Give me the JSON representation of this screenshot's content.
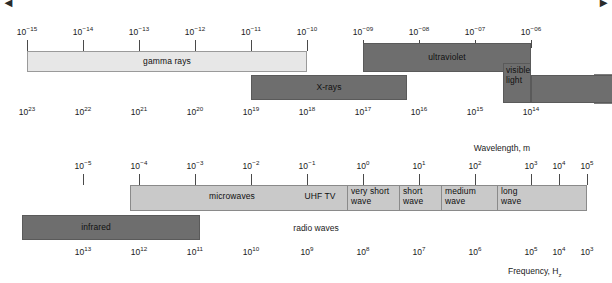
{
  "figure": {
    "background": "#ffffff",
    "corner_top_left": "◄",
    "corner_top_right": "►"
  },
  "colors": {
    "band_light": "#d6d6d6",
    "band_lightest": "#e7e7e7",
    "band_dark": "#6e6e6e",
    "band_mid": "#c9c9c9",
    "stroke": "#7d7d7d",
    "text": "#101010"
  },
  "chart_data": {
    "type": "diagram",
    "xlabel_top": "Wavelength, m",
    "xlabel_bottom": "Frequency, Hz",
    "rows": [
      {
        "id": "upper",
        "wavelength_ticks": [
          "10⁻¹⁵",
          "10⁻¹⁴",
          "10⁻¹³",
          "10⁻¹²",
          "10⁻¹¹",
          "10⁻¹⁰",
          "10⁻⁰⁹",
          "10⁻⁰⁸",
          "10⁻⁰⁷",
          "10⁻⁰⁶"
        ],
        "frequency_ticks": [
          "10²³",
          "10²²",
          "10²¹",
          "10²⁰",
          "10¹⁹",
          "10¹⁸",
          "10¹⁷",
          "10¹⁶",
          "10¹⁵",
          "10¹⁴"
        ],
        "bands": [
          {
            "name": "gamma rays",
            "from": "10⁻¹⁵",
            "to": "10⁻¹⁰",
            "shade": "lightest"
          },
          {
            "name": "ultraviolet",
            "from": "10⁻⁰⁹",
            "to": "10⁻⁰⁶",
            "shade": "dark"
          },
          {
            "name": "X-rays",
            "from": "10⁻¹¹·⁵",
            "to": "10⁻¹⁶",
            "shade": "dark"
          },
          {
            "name": "visible light",
            "from": "10⁻⁰⁶·⁵",
            "to": "10⁻⁰⁶",
            "shade": "dark"
          }
        ]
      },
      {
        "id": "lower",
        "wavelength_ticks": [
          "10⁻⁵",
          "10⁻⁴",
          "10⁻³",
          "10⁻²",
          "10⁻¹",
          "10⁰",
          "10¹",
          "10²",
          "10³",
          "10⁴",
          "10⁵"
        ],
        "frequency_ticks": [
          "10¹³",
          "10¹²",
          "10¹¹",
          "10¹⁰",
          "10⁹",
          "10⁸",
          "10⁷",
          "10⁶",
          "10⁵",
          "10⁴",
          "10³"
        ],
        "bands": [
          {
            "name": "infrared",
            "shade": "dark"
          },
          {
            "name": "microwaves",
            "shade": "mid"
          },
          {
            "name": "UHF TV",
            "shade": "mid"
          },
          {
            "name": "very short wave",
            "shade": "mid"
          },
          {
            "name": "short wave",
            "shade": "mid"
          },
          {
            "name": "medium wave",
            "shade": "mid"
          },
          {
            "name": "long wave",
            "shade": "mid"
          },
          {
            "name": "radio waves",
            "shade": "none"
          }
        ]
      }
    ]
  },
  "top": {
    "wavelength_ticks": [
      {
        "label": "10",
        "exp": "−15",
        "x": 27
      },
      {
        "label": "10",
        "exp": "−14",
        "x": 83
      },
      {
        "label": "10",
        "exp": "−13",
        "x": 139
      },
      {
        "label": "10",
        "exp": "−12",
        "x": 195
      },
      {
        "label": "10",
        "exp": "−11",
        "x": 251
      },
      {
        "label": "10",
        "exp": "−10",
        "x": 307
      },
      {
        "label": "10",
        "exp": "−09",
        "x": 363
      },
      {
        "label": "10",
        "exp": "−08",
        "x": 419
      },
      {
        "label": "10",
        "exp": "−07",
        "x": 475
      },
      {
        "label": "10",
        "exp": "−06",
        "x": 531
      }
    ],
    "frequency_ticks": [
      {
        "label": "10",
        "exp": "23",
        "x": 27
      },
      {
        "label": "10",
        "exp": "22",
        "x": 83
      },
      {
        "label": "10",
        "exp": "21",
        "x": 139
      },
      {
        "label": "10",
        "exp": "20",
        "x": 195
      },
      {
        "label": "10",
        "exp": "19",
        "x": 251
      },
      {
        "label": "10",
        "exp": "18",
        "x": 307
      },
      {
        "label": "10",
        "exp": "17",
        "x": 363
      },
      {
        "label": "10",
        "exp": "16",
        "x": 419
      },
      {
        "label": "10",
        "exp": "15",
        "x": 475
      },
      {
        "label": "10",
        "exp": "14",
        "x": 531
      }
    ],
    "bands": {
      "gamma": "gamma rays",
      "xrays": "X-rays",
      "ultraviolet": "ultraviolet",
      "visible_line1": "visible",
      "visible_line2": "light"
    }
  },
  "bottom": {
    "wavelength_ticks": [
      {
        "label": "10",
        "exp": "−5",
        "x": 83
      },
      {
        "label": "10",
        "exp": "−4",
        "x": 139
      },
      {
        "label": "10",
        "exp": "−3",
        "x": 195
      },
      {
        "label": "10",
        "exp": "−2",
        "x": 251
      },
      {
        "label": "10",
        "exp": "−1",
        "x": 307
      },
      {
        "label": "10",
        "exp": "0",
        "x": 363
      },
      {
        "label": "10",
        "exp": "1",
        "x": 419
      },
      {
        "label": "10",
        "exp": "2",
        "x": 475
      },
      {
        "label": "10",
        "exp": "3",
        "x": 531
      },
      {
        "label": "10",
        "exp": "4",
        "x": 559
      },
      {
        "label": "10",
        "exp": "5",
        "x": 587
      }
    ],
    "frequency_ticks": [
      {
        "label": "10",
        "exp": "13",
        "x": 83
      },
      {
        "label": "10",
        "exp": "12",
        "x": 139
      },
      {
        "label": "10",
        "exp": "11",
        "x": 195
      },
      {
        "label": "10",
        "exp": "10",
        "x": 251
      },
      {
        "label": "10",
        "exp": "9",
        "x": 307
      },
      {
        "label": "10",
        "exp": "8",
        "x": 363
      },
      {
        "label": "10",
        "exp": "7",
        "x": 419
      },
      {
        "label": "10",
        "exp": "6",
        "x": 475
      },
      {
        "label": "10",
        "exp": "5",
        "x": 531
      },
      {
        "label": "10",
        "exp": "4",
        "x": 559
      },
      {
        "label": "10",
        "exp": "3",
        "x": 587
      }
    ],
    "bands": {
      "infrared": "infrared",
      "microwaves": "microwaves",
      "uhf_tv": "UHF TV",
      "very_short_l1": "very short",
      "very_short_l2": "wave",
      "short_l1": "short",
      "short_l2": "wave",
      "medium_l1": "medium",
      "medium_l2": "wave",
      "long_l1": "long",
      "long_l2": "wave",
      "radio_waves": "radio waves"
    }
  },
  "axis_titles": {
    "wavelength": "Wavelength, m",
    "frequency_text": "Frequency, H",
    "frequency_sub": "z"
  }
}
